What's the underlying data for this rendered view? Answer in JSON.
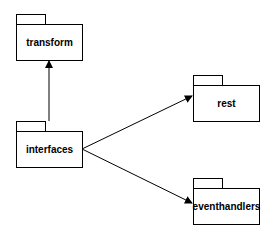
{
  "diagram": {
    "type": "uml-package-diagram",
    "packages": [
      {
        "id": "transform",
        "label": "transform"
      },
      {
        "id": "interfaces",
        "label": "interfaces"
      },
      {
        "id": "rest",
        "label": "rest"
      },
      {
        "id": "eventhandlers",
        "label": "eventhandlers"
      }
    ],
    "dependencies": [
      {
        "from": "interfaces",
        "to": "transform"
      },
      {
        "from": "interfaces",
        "to": "rest"
      },
      {
        "from": "interfaces",
        "to": "eventhandlers"
      }
    ],
    "colors": {
      "stroke": "#000000",
      "background": "#ffffff"
    }
  }
}
